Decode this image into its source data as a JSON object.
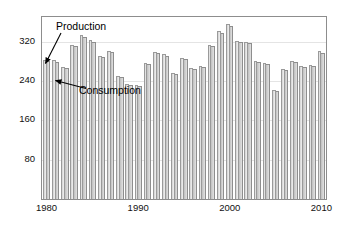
{
  "chart_data": {
    "type": "bar",
    "title": "",
    "subtitle": "",
    "xlabel": "",
    "ylabel": "",
    "xlim": [
      1979.5,
      2010.5
    ],
    "ylim": [
      0,
      370
    ],
    "grid": true,
    "grid_axis": "y",
    "legend": "annotations",
    "x_tick_labels": [
      "1980",
      "1990",
      "2000",
      "2010"
    ],
    "x_ticks": [
      1980,
      1990,
      2000,
      2010
    ],
    "y_tick_labels": [
      "80",
      "160",
      "240",
      "320"
    ],
    "y_ticks": [
      80,
      160,
      240,
      320
    ],
    "categories": [
      1980,
      1981,
      1982,
      1983,
      1984,
      1985,
      1986,
      1987,
      1988,
      1989,
      1990,
      1991,
      1992,
      1993,
      1994,
      1995,
      1996,
      1997,
      1998,
      1999,
      2000,
      2001,
      2002,
      2003,
      2004,
      2005,
      2006,
      2007,
      2008,
      2009,
      2010
    ],
    "series": [
      {
        "name": "Production",
        "color": "#d2d2d2",
        "values": [
          283,
          282,
          268,
          314,
          333,
          323,
          291,
          300,
          251,
          234,
          232,
          277,
          299,
          294,
          256,
          287,
          266,
          271,
          314,
          341,
          355,
          322,
          320,
          281,
          277,
          222,
          265,
          281,
          270,
          273,
          300
        ]
      },
      {
        "name": "Consumption",
        "color": "#c0c0c0",
        "values": [
          280,
          279,
          266,
          311,
          330,
          320,
          289,
          298,
          249,
          232,
          230,
          274,
          296,
          291,
          254,
          284,
          264,
          269,
          311,
          338,
          352,
          319,
          317,
          278,
          274,
          220,
          262,
          278,
          268,
          271,
          297
        ]
      }
    ],
    "annotations": [
      {
        "name": "production",
        "text": "Production",
        "points_to_series": "Production"
      },
      {
        "name": "consumption",
        "text": "Consumption",
        "points_to_series": "Consumption"
      }
    ]
  },
  "figure": {
    "caption": ""
  }
}
